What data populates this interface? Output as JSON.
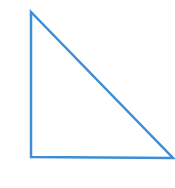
{
  "canvas": {
    "width": 175,
    "height": 188,
    "background_color": "#ffffff",
    "description": "white blank drawing canvas"
  },
  "figure": {
    "name": "right-triangle",
    "shape_type": "triangle",
    "subtype": "right triangle",
    "orientation": "right angle at bottom-left; hypotenuse descends from top-left apex to bottom-right",
    "filled": false,
    "fill_color": "none",
    "stroke_color": "#3d8ed6",
    "stroke_width": 2.5,
    "vertices": [
      {
        "name": "apex-top-left",
        "x": 31,
        "y": 12
      },
      {
        "name": "vertex-bottom-left",
        "x": 31,
        "y": 157
      },
      {
        "name": "vertex-bottom-right",
        "x": 173,
        "y": 158
      }
    ],
    "points_attr": "31,12 31,157 173,158",
    "edges": [
      {
        "name": "left-leg-vertical",
        "from": "apex-top-left",
        "to": "vertex-bottom-left",
        "length_px": 145
      },
      {
        "name": "bottom-leg-horizontal",
        "from": "vertex-bottom-left",
        "to": "vertex-bottom-right",
        "length_px": 142
      },
      {
        "name": "hypotenuse",
        "from": "vertex-bottom-right",
        "to": "apex-top-left",
        "length_px": 203
      }
    ],
    "right_angle_at": "vertex-bottom-left"
  }
}
